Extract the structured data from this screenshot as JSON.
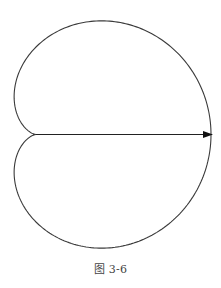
{
  "figure": {
    "caption": "图 3-6",
    "curve": {
      "type": "cardioid",
      "equation": "r = a(1 + cos θ)",
      "a": 87.5,
      "cusp": [
        36,
        134.5
      ],
      "stroke": "#3a3a3a",
      "stroke_width": 1.1
    },
    "axis_arrow": {
      "from": [
        36,
        134.5
      ],
      "to": [
        212,
        134.5
      ],
      "color": "#222222"
    }
  }
}
